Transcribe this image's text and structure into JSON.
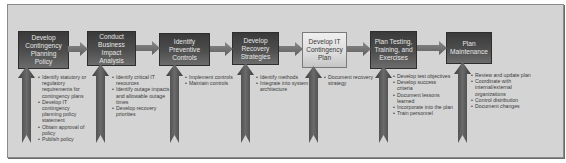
{
  "diagram": {
    "colors": {
      "frame_bg": "#d4d4d4",
      "dark_box": "#4a4a4a",
      "light_box": "#e2e2e2",
      "arrow": "#6e6e6e",
      "text_dark": "#3a3a3a"
    },
    "steps": [
      {
        "title": "Develop Contingency Planning Policy",
        "style": "dark",
        "bullets": [
          "Identify statutory or regulatory requirements for contingency plans",
          "Develop IT contingency planning policy statement",
          "Obtain approval of policy",
          "Publish policy"
        ]
      },
      {
        "title": "Conduct Business Impact Analysis",
        "style": "dark",
        "bullets": [
          "Identify critical IT resources",
          "Identify outage impacts and allowable outage times",
          "Develop recovery priorities"
        ]
      },
      {
        "title": "Identify Preventive Controls",
        "style": "dark",
        "bullets": [
          "Implement controls",
          "Maintain controls"
        ]
      },
      {
        "title": "Develop Recovery Strategies",
        "style": "dark",
        "bullets": [
          "Identify methods",
          "Integrate into system architecture"
        ]
      },
      {
        "title": "Develop IT Contingency Plan",
        "style": "light",
        "bullets": [
          "Document recovery strategy"
        ]
      },
      {
        "title": "Plan Testing, Training, and Exercises",
        "style": "dark",
        "bullets": [
          "Develop test objectives",
          "Develop success criteria",
          "Document lessons learned",
          "Incorporate into the plan",
          "Train personnel"
        ]
      },
      {
        "title": "Plan Maintenance",
        "style": "dark",
        "bullets": [
          "Review and update plan",
          "Coordinate with internal/external organizations",
          "Control distribution",
          "Document changes"
        ]
      }
    ]
  }
}
